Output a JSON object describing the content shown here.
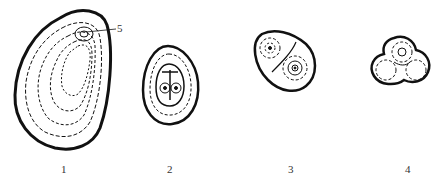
{
  "figure": {
    "panels": [
      {
        "label": "1",
        "description": "large ovoid granule with eccentric concentric layers"
      },
      {
        "label": "2",
        "description": "oval granule with concentric layers and compound center"
      },
      {
        "label": "3",
        "description": "compound granule of two parts"
      },
      {
        "label": "4",
        "description": "compound granule of three parts"
      }
    ],
    "callouts": [
      {
        "label": "5",
        "target": "hilum"
      }
    ]
  }
}
